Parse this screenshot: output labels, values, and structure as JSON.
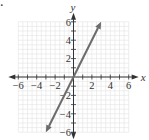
{
  "problem_marker": ".",
  "chart_data": {
    "type": "line",
    "title": "",
    "xlabel": "x",
    "ylabel": "y",
    "xlim": [
      -6,
      6
    ],
    "ylim": [
      -6,
      6
    ],
    "grid": true,
    "x_ticks": [
      -6,
      -4,
      -2,
      2,
      4,
      6
    ],
    "y_ticks": [
      6,
      4,
      2,
      -2,
      -4,
      -6
    ],
    "x_tick_labels": [
      "−6",
      "−4",
      "−2",
      "2",
      "4",
      "6"
    ],
    "y_tick_labels": [
      "6",
      "4",
      "2",
      "−2",
      "−4",
      "−6"
    ],
    "series": [
      {
        "name": "y = 2x",
        "x": [
          -3,
          0,
          3
        ],
        "y": [
          -6,
          0,
          6
        ],
        "arrows": "both",
        "color": "#666666"
      }
    ]
  },
  "colors": {
    "grid": "#e3e3e3",
    "axis": "#333333",
    "line": "#6b6b6b"
  }
}
